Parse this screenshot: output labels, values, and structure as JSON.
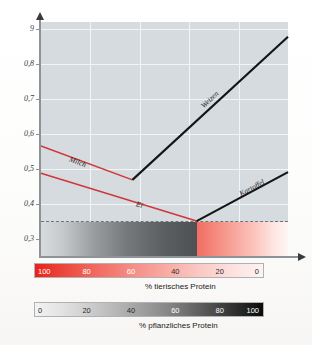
{
  "chart_data": {
    "type": "line",
    "title": "",
    "xlabel": "",
    "ylabel": "",
    "xlim": [
      100,
      0
    ],
    "ylim": [
      0.25,
      0.92
    ],
    "grid": true,
    "legend_position": "inline-labels",
    "y_ticks": [
      "9",
      "0,8",
      "0,7",
      "0,6",
      "0,5",
      "0,4",
      "0,3"
    ],
    "y_tick_values": [
      0.9,
      0.8,
      0.7,
      0.6,
      0.5,
      0.4,
      0.3
    ],
    "threshold_line": {
      "value": 0.35,
      "style": "dashed",
      "label": ""
    },
    "series": [
      {
        "name": "Milch",
        "color": "#d0373a",
        "points": [
          [
            100,
            0.565
          ],
          [
            63,
            0.468
          ]
        ]
      },
      {
        "name": "Weizen",
        "color": "#141414",
        "points": [
          [
            63,
            0.468
          ],
          [
            0,
            0.878
          ]
        ]
      },
      {
        "name": "Ei",
        "color": "#d0373a",
        "points": [
          [
            100,
            0.487
          ],
          [
            37,
            0.35
          ]
        ]
      },
      {
        "name": "Kartoffel",
        "color": "#141414",
        "points": [
          [
            37,
            0.35
          ],
          [
            0,
            0.49
          ]
        ]
      }
    ]
  },
  "plot": {
    "background_color": "#d6dbdf",
    "gridline_color": "#f2f4f6",
    "axis_color": "#8d9296"
  },
  "colorbars": [
    {
      "id": "animal-protein",
      "caption": "% tierisches Protein",
      "direction": "high-to-low",
      "ticks": [
        "100",
        "80",
        "60",
        "40",
        "20",
        "0"
      ],
      "tick_values": [
        100,
        80,
        60,
        40,
        20,
        0
      ],
      "start_color": "#e8221b",
      "end_color": "#fdf3f2"
    },
    {
      "id": "plant-protein",
      "caption": "% pflanzliches Protein",
      "direction": "low-to-high",
      "ticks": [
        "0",
        "20",
        "40",
        "60",
        "80",
        "100"
      ],
      "tick_values": [
        0,
        20,
        40,
        60,
        80,
        100
      ],
      "start_color": "#f3f3f3",
      "end_color": "#0b0b0b"
    }
  ],
  "figure_caption": ""
}
